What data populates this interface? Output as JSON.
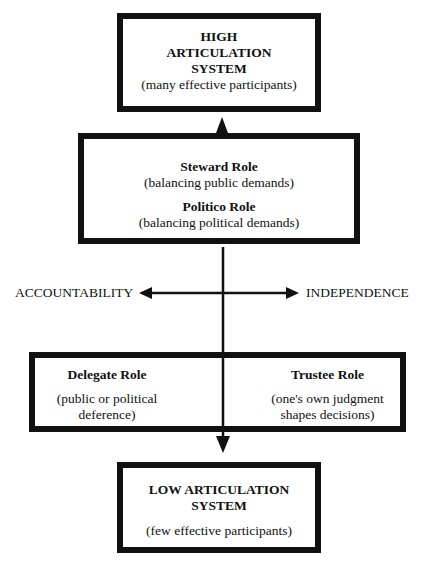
{
  "diagram": {
    "top_box": {
      "title_lines": [
        "HIGH",
        "ARTICULATION",
        "SYSTEM"
      ],
      "subtitle": "(many effective participants)"
    },
    "middle_box": {
      "role1_title": "Steward Role",
      "role1_desc": "(balancing public demands)",
      "role2_title": "Politico Role",
      "role2_desc": "(balancing political demands)"
    },
    "axis": {
      "left_label": "ACCOUNTABILITY",
      "right_label": "INDEPENDENCE"
    },
    "lower_box": {
      "left_title": "Delegate Role",
      "left_desc_lines": [
        "(public or political",
        "deference)"
      ],
      "right_title": "Trustee Role",
      "right_desc_lines": [
        "(one's own judgment",
        "shapes decisions)"
      ]
    },
    "bottom_box": {
      "title_lines": [
        "LOW ARTICULATION",
        "SYSTEM"
      ],
      "subtitle": "(few effective participants)"
    },
    "colors": {
      "line": "#111111",
      "background": "#ffffff"
    }
  }
}
